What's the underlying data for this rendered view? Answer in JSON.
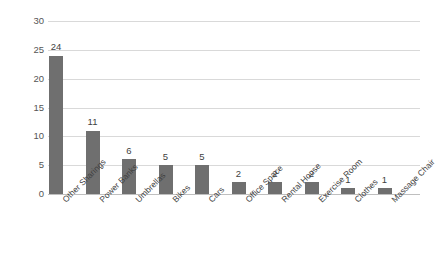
{
  "chart_data": {
    "type": "bar",
    "title": "",
    "subtitle": "",
    "xlabel": "",
    "ylabel": "",
    "categories": [
      "Other Sharings",
      "Power Banks",
      "Umbrellas",
      "Bikes",
      "Cars",
      "Office Space",
      "Rental House",
      "Exercise Room",
      "Clothes",
      "Massage Chair"
    ],
    "values": [
      24,
      11,
      6,
      5,
      5,
      2,
      2,
      2,
      1,
      1
    ],
    "value_labels": [
      "24",
      "11",
      "6",
      "5",
      "5",
      "2",
      "2",
      "2",
      "1",
      "1"
    ],
    "ylim": [
      0,
      30
    ],
    "y_ticks": [
      30,
      25,
      20,
      15,
      10,
      5,
      0
    ],
    "y_tick_labels": [
      "30",
      "25",
      "20",
      "15",
      "10",
      "5",
      "0"
    ],
    "grid": "horizontal",
    "legend": "none",
    "bar_color": "#6f6f6f",
    "gridline_color": "#d9d9d9",
    "axis_color": "#bfbfbf",
    "text_color": "#3f3f3f",
    "background": "#ffffff",
    "label_rotation_degrees": -45
  }
}
